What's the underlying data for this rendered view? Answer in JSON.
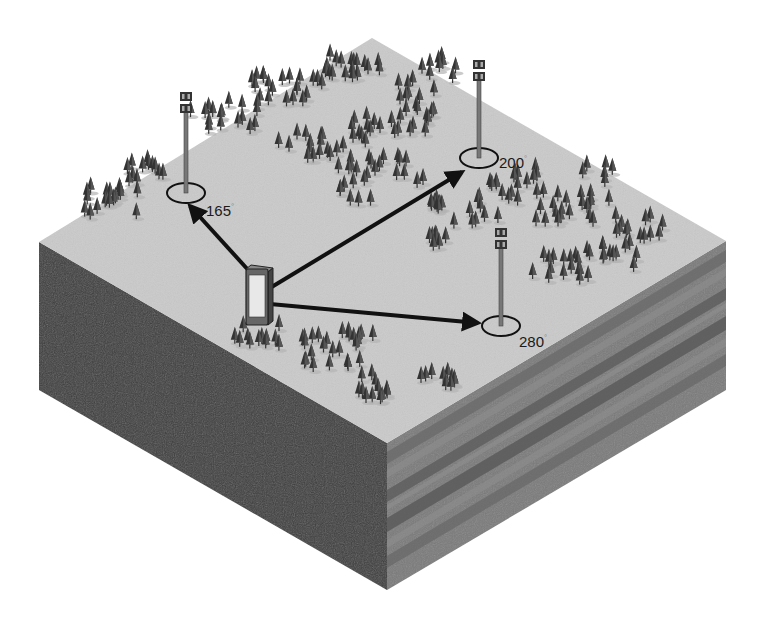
{
  "diagram": {
    "type": "isometric-terrain-block",
    "colors": {
      "background": "#ffffff",
      "top_surface": "#c9c9c9",
      "left_face": "#3c3c3c",
      "right_face": "#777777",
      "right_face_band_dark": "#5e5e5e",
      "right_face_band_light": "#8e8e8e",
      "tree": "#3a3a3a",
      "tree_shadow": "#b0b0b0",
      "arrow": "#111111",
      "tower": "#6e6e6e",
      "ring": "#111111",
      "phone_body": "#555555",
      "phone_screen": "#e6e6e6"
    },
    "towers": [
      {
        "id": "tower-1",
        "bearing_label": "165",
        "degree_symbol": "°",
        "base_x": 186,
        "base_y": 193,
        "top_y": 92,
        "label_x": 206,
        "label_y": 216
      },
      {
        "id": "tower-2",
        "bearing_label": "200",
        "degree_symbol": "°",
        "base_x": 479,
        "base_y": 158,
        "top_y": 60,
        "label_x": 499,
        "label_y": 168
      },
      {
        "id": "tower-3",
        "bearing_label": "280",
        "degree_symbol": "°",
        "base_x": 501,
        "base_y": 326,
        "top_y": 228,
        "label_x": 519,
        "label_y": 347
      }
    ],
    "phone": {
      "x": 246,
      "y": 265,
      "width": 22,
      "height": 58
    },
    "arrows": [
      {
        "from": [
          250,
          272
        ],
        "to": [
          190,
          206
        ],
        "target": "tower-1"
      },
      {
        "from": [
          270,
          288
        ],
        "to": [
          462,
          172
        ],
        "target": "tower-2"
      },
      {
        "from": [
          270,
          304
        ],
        "to": [
          478,
          323
        ],
        "target": "tower-3"
      }
    ]
  }
}
